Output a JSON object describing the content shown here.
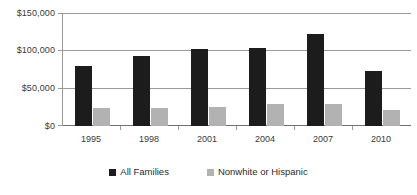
{
  "chart_data": {
    "type": "bar",
    "title": "",
    "subtitle": "",
    "xlabel": "",
    "ylabel": "",
    "categories": [
      "1995",
      "1998",
      "2001",
      "2004",
      "2007",
      "2010"
    ],
    "series": [
      {
        "name": "All Families",
        "color": "#1c1c1c",
        "values": [
          79000,
          93000,
          102000,
          104000,
          122000,
          73000
        ]
      },
      {
        "name": "Nonwhite or Hispanic",
        "color": "#b2b2b2",
        "values": [
          24000,
          24000,
          25000,
          29000,
          29000,
          21000
        ]
      }
    ],
    "ylim": [
      0,
      150000
    ],
    "y_ticks": [
      0,
      50000,
      100000,
      150000
    ],
    "y_tick_labels": [
      "$0",
      "$50,000",
      "$100,000",
      "$150,000"
    ],
    "grid": true,
    "legend_position": "bottom"
  },
  "legend": {
    "items": [
      {
        "label": "All Families",
        "swatch": "legend-swatch-black"
      },
      {
        "label": "Nonwhite or Hispanic",
        "swatch": "legend-swatch-gray"
      }
    ]
  }
}
